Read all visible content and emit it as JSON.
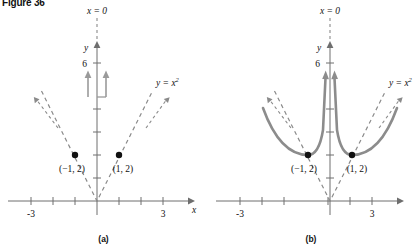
{
  "figure": {
    "label": "Figure 36",
    "panels": [
      {
        "caption": "(a)",
        "axis_x_label": "x",
        "axis_y_label": "y",
        "x_ticks": [
          "-3",
          "3"
        ],
        "y_ticks": [
          "6"
        ],
        "vertical_line_label": "x = 0",
        "curve_label": "y = x",
        "curve_label_exp": "2",
        "points": [
          {
            "label": "(−1, 2)",
            "x": -1,
            "y": 2
          },
          {
            "label": "(1, 2)",
            "x": 1,
            "y": 2
          }
        ]
      },
      {
        "caption": "(b)",
        "axis_x_label": "x",
        "axis_y_label": "y",
        "x_ticks": [
          "-3",
          "3"
        ],
        "y_ticks": [
          "6"
        ],
        "vertical_line_label": "x = 0",
        "curve_label": "y = x",
        "curve_label_exp": "2",
        "points": [
          {
            "label": "(−1, 2)",
            "x": -1,
            "y": 2
          },
          {
            "label": "(1, 2)",
            "x": 1,
            "y": 2
          }
        ]
      }
    ],
    "colors": {
      "axis": "#6e6e6e",
      "dashed_curve": "#8a8a8a",
      "solid_curve": "#8c8c8c",
      "point": "#111111",
      "text": "#111111"
    }
  }
}
